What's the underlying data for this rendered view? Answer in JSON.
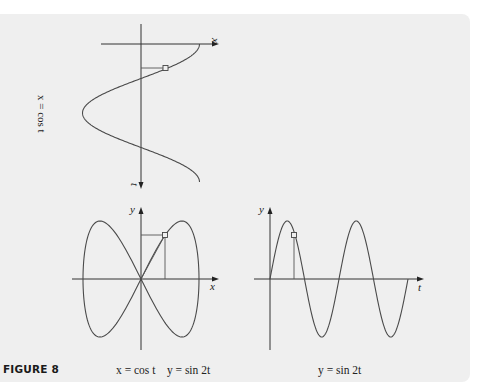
{
  "figure": {
    "label": "FIGURE 8",
    "top_graph": {
      "horizontal_axis_label": "x",
      "vertical_axis_label": "t",
      "side_label": "x = cos t",
      "curve": "x = cos t, 0 ≤ t ≤ 2π (t axis pointing downward)"
    },
    "bottom_left_graph": {
      "x_axis_label": "x",
      "y_axis_label": "y",
      "caption_x": "x = cos t",
      "caption_y": "y = sin 2t",
      "curve": "parametric (cos t, sin 2t), figure-eight"
    },
    "bottom_right_graph": {
      "x_axis_label": "t",
      "y_axis_label": "y",
      "caption": "y = sin 2t",
      "curve": "y = sin 2t, 0 ≤ t ≤ 2π"
    },
    "colors": {
      "panel_background": "#efefef",
      "page_background": "#ffffff",
      "curve": "#4a4a4a",
      "axis": "#333333",
      "label_text": "#1a1a1a"
    }
  }
}
